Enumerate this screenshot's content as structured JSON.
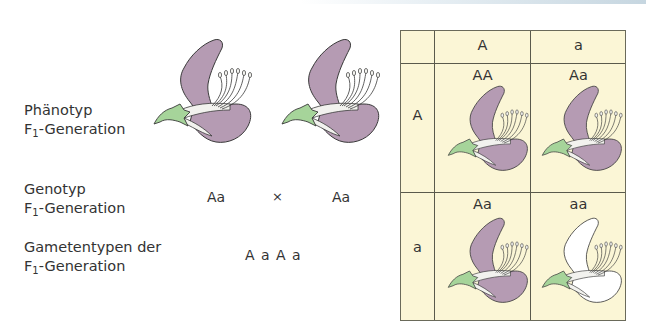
{
  "labels": {
    "phenotype_line1": "Phänotyp",
    "phenotype_line2_prefix": "F",
    "phenotype_line2_sub": "1",
    "phenotype_line2_suffix": "-Generation",
    "genotype_line1": "Genotyp",
    "genotype_line2_prefix": "F",
    "genotype_line2_sub": "1",
    "genotype_line2_suffix": "-Generation",
    "gametes_line1": "Gametentypen der",
    "gametes_line2_prefix": "F",
    "gametes_line2_sub": "1",
    "gametes_line2_suffix": "-Generation"
  },
  "cross": {
    "parent1": "Aa",
    "operator": "×",
    "parent2": "Aa",
    "gametes": "A a A a"
  },
  "punnett": {
    "col_headers": [
      "A",
      "a"
    ],
    "row_headers": [
      "A",
      "a"
    ],
    "cells": [
      {
        "genotype": "AA",
        "phenotype": "purple"
      },
      {
        "genotype": "Aa",
        "phenotype": "purple"
      },
      {
        "genotype": "Aa",
        "phenotype": "purple"
      },
      {
        "genotype": "aa",
        "phenotype": "white"
      }
    ]
  },
  "colors": {
    "petal_purple": "#b59bb3",
    "petal_white": "#ffffff",
    "sepal_green": "#a6d49a",
    "table_bg": "#fbf6d6",
    "outline": "#3a3a3a"
  }
}
